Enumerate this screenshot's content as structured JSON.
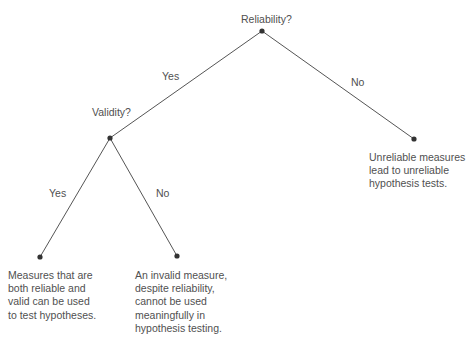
{
  "diagram": {
    "type": "decision-tree",
    "line_color": "#555555",
    "node_color": "#333333",
    "nodes": [
      {
        "id": "root",
        "label": "Reliability?",
        "x": 262,
        "y": 31
      },
      {
        "id": "validity",
        "label": "Validity?",
        "x": 110,
        "y": 138
      },
      {
        "id": "unreliable",
        "label": "",
        "x": 414,
        "y": 139
      },
      {
        "id": "valid",
        "label": "",
        "x": 40,
        "y": 257
      },
      {
        "id": "invalid",
        "label": "",
        "x": 177,
        "y": 256
      }
    ],
    "edges": [
      {
        "from": "root",
        "to": "validity",
        "label": "Yes"
      },
      {
        "from": "root",
        "to": "unreliable",
        "label": "No"
      },
      {
        "from": "validity",
        "to": "valid",
        "label": "Yes"
      },
      {
        "from": "validity",
        "to": "invalid",
        "label": "No"
      }
    ],
    "questions": {
      "root": "Reliability?",
      "validity": "Validity?"
    },
    "edge_labels": {
      "root_yes": "Yes",
      "root_no": "No",
      "validity_yes": "Yes",
      "validity_no": "No"
    },
    "outcomes": {
      "unreliable": "Unreliable measures\nlead to unreliable\nhypothesis tests.",
      "valid": "Measures that are\nboth reliable and\nvalid can be used\nto test hypotheses.",
      "invalid": "An invalid measure,\ndespite reliability,\ncannot be used\nmeaningfully in\nhypothesis testing."
    }
  }
}
